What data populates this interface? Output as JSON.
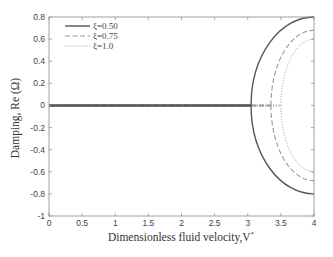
{
  "chart_data": {
    "type": "line",
    "title": "",
    "xlabel": "Dimensionless fluid velocity,V",
    "xlabel_superscript": "*",
    "ylabel": "Damping, Re (Ω)",
    "xlim": [
      0,
      4
    ],
    "ylim": [
      -1,
      0.8
    ],
    "xticks": [
      0,
      0.5,
      1,
      1.5,
      2,
      2.5,
      3,
      3.5,
      4
    ],
    "xtick_labels": [
      "0",
      "0.5",
      "1",
      "1.5",
      "2",
      "2.5",
      "3",
      "3.5",
      "4"
    ],
    "yticks": [
      -1,
      -0.8,
      -0.6,
      -0.4,
      -0.2,
      0,
      0.2,
      0.4,
      0.6,
      0.8
    ],
    "ytick_labels": [
      "-1",
      "-0.8",
      "-0.6",
      "-0.4",
      "-0.2",
      "0",
      "0.2",
      "0.4",
      "0.6",
      "0.8"
    ],
    "grid": false,
    "legend_position": "upper left",
    "series": [
      {
        "name": "ξ=0.50",
        "style": "solid",
        "color": "#555555",
        "critical_velocity": 3.05,
        "x": [
          0,
          3.05,
          3.1,
          3.2,
          3.35,
          3.5,
          3.7,
          3.9,
          4.0
        ],
        "y_upper": [
          0,
          0,
          0.2,
          0.34,
          0.48,
          0.6,
          0.7,
          0.77,
          0.8
        ],
        "y_lower": [
          0,
          0,
          -0.2,
          -0.34,
          -0.48,
          -0.6,
          -0.7,
          -0.77,
          -0.8
        ]
      },
      {
        "name": "ξ=0.75",
        "style": "dashed",
        "color": "#999999",
        "critical_velocity": 3.35,
        "x": [
          0,
          3.35,
          3.4,
          3.5,
          3.65,
          3.8,
          4.0
        ],
        "y_upper": [
          0,
          0,
          0.16,
          0.3,
          0.45,
          0.56,
          0.68
        ],
        "y_lower": [
          0,
          0,
          -0.16,
          -0.3,
          -0.45,
          -0.56,
          -0.68
        ]
      },
      {
        "name": "ξ=1.0",
        "style": "dotted",
        "color": "#aaaaaa",
        "critical_velocity": 3.5,
        "x": [
          0,
          3.5,
          3.55,
          3.65,
          3.8,
          4.0
        ],
        "y_upper": [
          0,
          0,
          0.15,
          0.3,
          0.45,
          0.6
        ],
        "y_lower": [
          0,
          0,
          -0.15,
          -0.3,
          -0.45,
          -0.6
        ]
      }
    ]
  },
  "legend": {
    "items": [
      {
        "label": "ξ=0.50"
      },
      {
        "label": "ξ=0.75"
      },
      {
        "label": "ξ=1.0"
      }
    ]
  },
  "axes": {
    "xlabel": "Dimensionless fluid velocity,V",
    "xlabel_sup": "*",
    "ylabel": "Damping, Re (Ω)"
  }
}
